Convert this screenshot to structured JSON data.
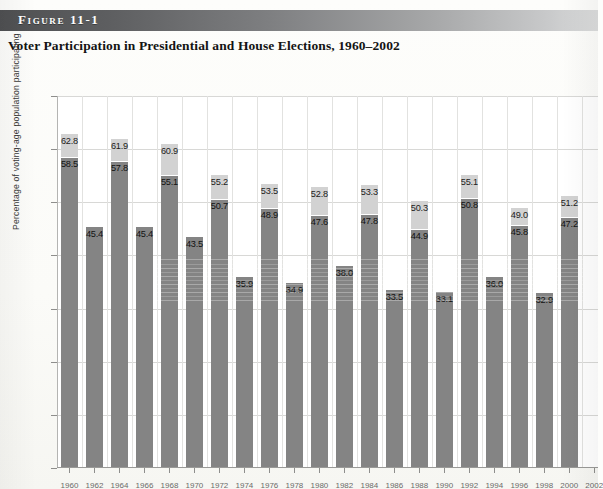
{
  "figure": {
    "band_label": "Figure 11-1",
    "title": "Voter Participation in Presidential and House Elections, 1960–2002"
  },
  "colors": {
    "presidential_bar": "#d2d2d2",
    "house_bar": "#848484",
    "band_dark": "#4f5052",
    "band_light": "#dcdddd",
    "gridline": "#d8d8d6"
  },
  "chart_data": {
    "type": "bar",
    "title": "Voter Participation in Presidential and House Elections, 1960–2002",
    "xlabel": "",
    "ylabel": "Percentage of voting-age population participating",
    "ylim": [
      0,
      70
    ],
    "yticks": [
      0,
      10,
      20,
      30,
      40,
      50,
      60,
      70
    ],
    "ytick_labels": [
      "0",
      "10",
      "20",
      "30",
      "40",
      "50",
      "60",
      "70"
    ],
    "grid": true,
    "legend": "none",
    "categories": [
      "1960",
      "1962",
      "1964",
      "1966",
      "1968",
      "1970",
      "1972",
      "1974",
      "1976",
      "1978",
      "1980",
      "1982",
      "1984",
      "1986",
      "1988",
      "1990",
      "1992",
      "1994",
      "1996",
      "1998",
      "2000",
      "2002"
    ],
    "series": [
      {
        "name": "Presidential election turnout",
        "values": [
          62.8,
          null,
          61.9,
          null,
          60.9,
          null,
          55.2,
          null,
          53.5,
          null,
          52.8,
          null,
          53.3,
          null,
          50.3,
          null,
          55.1,
          null,
          49.0,
          null,
          51.2,
          null
        ]
      },
      {
        "name": "House election turnout",
        "values": [
          58.5,
          45.4,
          57.8,
          45.4,
          55.1,
          43.5,
          50.7,
          35.9,
          48.9,
          34.9,
          47.6,
          38.0,
          47.8,
          33.5,
          44.9,
          33.1,
          50.8,
          36.0,
          45.8,
          32.9,
          47.2,
          null
        ]
      }
    ],
    "bars": [
      {
        "year": "1960",
        "presidential": 62.8,
        "house": 58.5,
        "type": "presidential"
      },
      {
        "year": "1962",
        "presidential": null,
        "house": 45.4,
        "type": "midterm"
      },
      {
        "year": "1964",
        "presidential": 61.9,
        "house": 57.8,
        "type": "presidential"
      },
      {
        "year": "1966",
        "presidential": null,
        "house": 45.4,
        "type": "midterm"
      },
      {
        "year": "1968",
        "presidential": 60.9,
        "house": 55.1,
        "type": "presidential"
      },
      {
        "year": "1970",
        "presidential": null,
        "house": 43.5,
        "type": "midterm"
      },
      {
        "year": "1972",
        "presidential": 55.2,
        "house": 50.7,
        "type": "presidential"
      },
      {
        "year": "1974",
        "presidential": null,
        "house": 35.9,
        "type": "midterm"
      },
      {
        "year": "1976",
        "presidential": 53.5,
        "house": 48.9,
        "type": "presidential"
      },
      {
        "year": "1978",
        "presidential": null,
        "house": 34.9,
        "type": "midterm"
      },
      {
        "year": "1980",
        "presidential": 52.8,
        "house": 47.6,
        "type": "presidential"
      },
      {
        "year": "1982",
        "presidential": null,
        "house": 38.0,
        "type": "midterm"
      },
      {
        "year": "1984",
        "presidential": 53.3,
        "house": 47.8,
        "type": "presidential"
      },
      {
        "year": "1986",
        "presidential": null,
        "house": 33.5,
        "type": "midterm"
      },
      {
        "year": "1988",
        "presidential": 50.3,
        "house": 44.9,
        "type": "presidential"
      },
      {
        "year": "1990",
        "presidential": null,
        "house": 33.1,
        "type": "midterm"
      },
      {
        "year": "1992",
        "presidential": 55.1,
        "house": 50.8,
        "type": "presidential"
      },
      {
        "year": "1994",
        "presidential": null,
        "house": 36.0,
        "type": "midterm"
      },
      {
        "year": "1996",
        "presidential": 49.0,
        "house": 45.8,
        "type": "presidential"
      },
      {
        "year": "1998",
        "presidential": null,
        "house": 32.9,
        "type": "midterm"
      },
      {
        "year": "2000",
        "presidential": 51.2,
        "house": 47.2,
        "type": "presidential"
      },
      {
        "year": "2002",
        "presidential": null,
        "house": null,
        "type": "midterm"
      }
    ]
  }
}
